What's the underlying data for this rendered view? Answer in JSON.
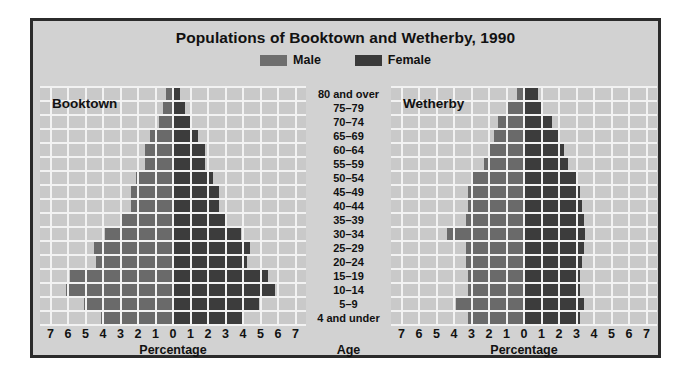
{
  "title": "Populations of Booktown and Wetherby, 1990",
  "legend": {
    "position": "top-center",
    "items": [
      {
        "label": "Male",
        "color": "#6e6e6e"
      },
      {
        "label": "Female",
        "color": "#3c3c3c"
      }
    ]
  },
  "age_axis_title": "Age",
  "x_axis_title": "Percentage",
  "x_ticks": [
    "7",
    "6",
    "5",
    "4",
    "3",
    "2",
    "1",
    "0",
    "1",
    "2",
    "3",
    "4",
    "5",
    "6",
    "7"
  ],
  "caption": "",
  "chart_data": {
    "type": "bar",
    "subtype": "population-pyramid",
    "title": "Populations of Booktown and Wetherby, 1990",
    "xlabel": "Percentage",
    "ylabel": "Age",
    "xlim": [
      0,
      7
    ],
    "grid": true,
    "legend_position": "top-center",
    "categories": [
      "80 and over",
      "75–79",
      "70–74",
      "65–69",
      "60–64",
      "55–59",
      "50–54",
      "45–49",
      "40–44",
      "35–39",
      "30–34",
      "25–29",
      "20–24",
      "15–19",
      "10–14",
      "5–9",
      "4 and under"
    ],
    "panels": [
      {
        "name": "Booktown",
        "series": [
          {
            "name": "Male",
            "side": "left",
            "values": [
              0.4,
              0.6,
              0.8,
              1.3,
              1.6,
              1.6,
              2.1,
              2.4,
              2.4,
              2.9,
              3.9,
              4.5,
              4.4,
              5.9,
              6.1,
              5.1,
              4.1
            ]
          },
          {
            "name": "Female",
            "side": "right",
            "values": [
              0.4,
              0.7,
              1.0,
              1.4,
              1.8,
              1.8,
              2.3,
              2.6,
              2.6,
              3.1,
              3.9,
              4.4,
              4.2,
              5.4,
              5.8,
              4.9,
              4.0
            ]
          }
        ]
      },
      {
        "name": "Wetherby",
        "series": [
          {
            "name": "Male",
            "side": "left",
            "values": [
              0.4,
              1.0,
              1.5,
              1.7,
              2.0,
              2.3,
              2.9,
              3.2,
              3.2,
              3.3,
              4.4,
              3.3,
              3.3,
              3.2,
              3.2,
              3.9,
              3.2
            ]
          },
          {
            "name": "Female",
            "side": "right",
            "values": [
              0.8,
              1.1,
              1.6,
              2.0,
              2.3,
              2.5,
              3.0,
              3.2,
              3.3,
              3.4,
              3.5,
              3.4,
              3.3,
              3.2,
              3.2,
              3.4,
              3.2
            ]
          }
        ]
      }
    ]
  }
}
